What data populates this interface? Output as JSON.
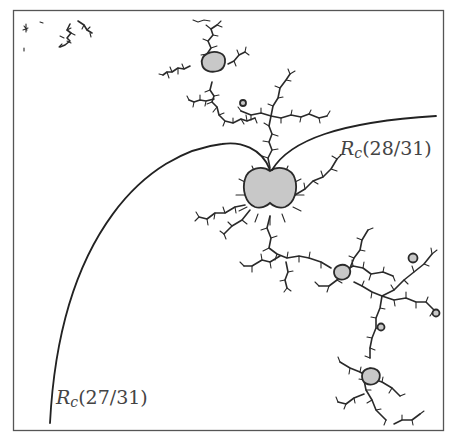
{
  "figure": {
    "colors": {
      "background": "#ffffff",
      "fractal_stroke": "#2a2a2a",
      "component_fill": "#c8c8c8",
      "ray_stroke": "#222222",
      "frame_stroke": "#555555",
      "label_color": "#444444"
    },
    "rays": [
      {
        "name": "ray-28-31",
        "label_symbol": "R",
        "label_subscript": "c",
        "label_argument": "(28/31)"
      },
      {
        "name": "ray-27-31",
        "label_symbol": "R",
        "label_subscript": "c",
        "label_argument": "(27/31)"
      }
    ]
  }
}
